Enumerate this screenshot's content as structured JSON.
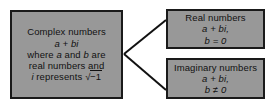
{
  "diagram": {
    "type": "classification-tree",
    "orientation": "left-to-right",
    "style": {
      "node_fill": "#989898",
      "node_border": "#1a1a1a",
      "connector_color": "#111111",
      "text_color": "#111111",
      "background": "#ffffff"
    },
    "nodes": [
      {
        "id": "complex",
        "role": "parent",
        "title": "Complex numbers",
        "lines": [
          "Complex numbers",
          "a + bi",
          "where a and b are",
          "real numbers and",
          "i represents √−1"
        ],
        "form": "a + bi",
        "condition": "where a and b are real numbers and i represents √−1",
        "line1": "Complex numbers",
        "line2_a": "a",
        "line2_op": " + ",
        "line2_b": "bi",
        "line3_pre": "where ",
        "line3_a": "a",
        "line3_mid": " and ",
        "line3_b": "b",
        "line3_post": " are",
        "line4": "real numbers and",
        "line5_i": "i",
        "line5_text": " represents",
        "line5_radical_sign": "√",
        "line5_radicand": "−1"
      },
      {
        "id": "real",
        "role": "child",
        "title": "Real numbers",
        "lines": [
          "Real numbers",
          "a + bi,",
          "b = 0"
        ],
        "form": "a + bi,",
        "condition": "b = 0",
        "form_a": "a",
        "form_op": " + ",
        "form_b": "bi,",
        "cond_var": "b",
        "cond_rel": " = ",
        "cond_val": "0"
      },
      {
        "id": "imaginary",
        "role": "child",
        "title": "Imaginary numbers",
        "lines": [
          "Imaginary numbers",
          "a + bi,",
          "b ≠ 0"
        ],
        "form": "a + bi,",
        "condition": "b ≠ 0",
        "form_a": "a",
        "form_op": " + ",
        "form_b": "bi,",
        "cond_var": "b",
        "cond_rel": " ≠ ",
        "cond_val": "0"
      }
    ],
    "connectors": [
      {
        "from": "complex",
        "to": "real",
        "shape": "straight-line"
      },
      {
        "from": "complex",
        "to": "imaginary",
        "shape": "straight-line"
      }
    ]
  }
}
